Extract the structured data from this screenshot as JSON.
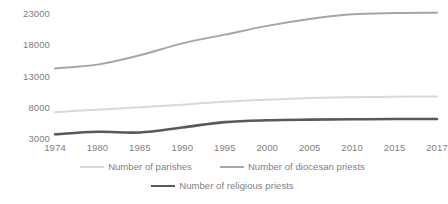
{
  "chart_data": {
    "type": "line",
    "title": "",
    "subtitle": "",
    "xlabel": "",
    "ylabel": "",
    "grid": false,
    "legend_position": "bottom",
    "x": [
      1974,
      1980,
      1985,
      1990,
      1995,
      2000,
      2005,
      2010,
      2015,
      2017
    ],
    "categories": [
      "1974",
      "1980",
      "1985",
      "1990",
      "1995",
      "2000",
      "2005",
      "2010",
      "2015",
      "2017"
    ],
    "xlim": [
      1974,
      2017
    ],
    "ylim": [
      3000,
      23000
    ],
    "yticks": [
      3000,
      8000,
      13000,
      18000,
      23000
    ],
    "ytick_labels": [
      "3000",
      "8000",
      "13000",
      "18000",
      "23000"
    ],
    "series": [
      {
        "name": "Number of parishes",
        "color": "#d9d9d9",
        "width": 2.0,
        "values": [
          7300,
          7700,
          8100,
          8500,
          8950,
          9300,
          9550,
          9700,
          9780,
          9800
        ]
      },
      {
        "name": "Number of diocesan priests",
        "color": "#a6a6a6",
        "width": 2.0,
        "values": [
          14300,
          14900,
          16400,
          18300,
          19700,
          21100,
          22200,
          22950,
          23150,
          23200
        ]
      },
      {
        "name": "Number of religious priests",
        "color": "#595959",
        "width": 2.6,
        "values": [
          3750,
          4150,
          4050,
          4850,
          5700,
          6000,
          6100,
          6150,
          6200,
          6200
        ]
      }
    ]
  },
  "legend": {
    "row1": [
      {
        "label": "Number of parishes",
        "color": "#d9d9d9",
        "width": 2.0
      },
      {
        "label": "Number of diocesan priests",
        "color": "#a6a6a6",
        "width": 2.0
      }
    ],
    "row2": [
      {
        "label": "Number of religious priests",
        "color": "#595959",
        "width": 2.6
      }
    ]
  }
}
